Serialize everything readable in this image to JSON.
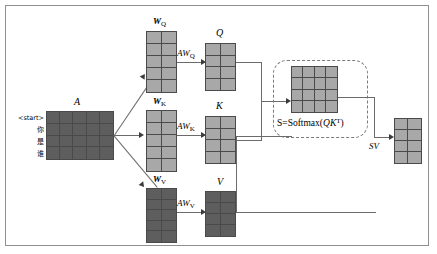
{
  "diagram": {
    "tokens": [
      "<start>",
      "你",
      "是",
      "谁"
    ],
    "matrices": {
      "A": {
        "label": "A",
        "rows": 4,
        "cols": 5,
        "shade": "dark"
      },
      "WQ": {
        "label": "W",
        "sub": "Q",
        "rows": 5,
        "cols": 2,
        "shade": "light"
      },
      "WK": {
        "label": "W",
        "sub": "K",
        "rows": 5,
        "cols": 2,
        "shade": "light"
      },
      "WV": {
        "label": "W",
        "sub": "V",
        "rows": 5,
        "cols": 2,
        "shade": "dark"
      },
      "Q": {
        "label": "Q",
        "rows": 4,
        "cols": 2,
        "shade": "light"
      },
      "K": {
        "label": "K",
        "rows": 4,
        "cols": 2,
        "shade": "light"
      },
      "V": {
        "label": "V",
        "rows": 4,
        "cols": 2,
        "shade": "dark"
      },
      "S": {
        "label": "S",
        "rows": 4,
        "cols": 4,
        "shade": "light"
      },
      "SV": {
        "label": "SV",
        "rows": 4,
        "cols": 2,
        "shade": "light"
      }
    },
    "edge_labels": {
      "AWQ_base": "AW",
      "AWQ_sub": "Q",
      "AWK_base": "AW",
      "AWK_sub": "K",
      "AWV_base": "AW",
      "AWV_sub": "V",
      "SV": "SV"
    },
    "softmax": {
      "prefix": "S=Softmax(",
      "q": "Q",
      "k": "K",
      "transpose": "T",
      "suffix": ")"
    },
    "colors": {
      "light_cell": "#a8a8a8",
      "dark_cell": "#5e5e5e",
      "cell_border": "#4a4a4a",
      "connector": "#6b6b6b",
      "frame": "#8f8f8f",
      "background": "#ffffff"
    }
  }
}
